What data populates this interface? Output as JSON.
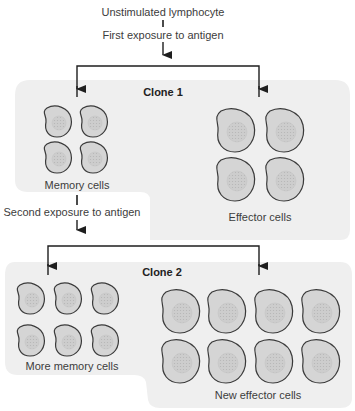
{
  "diagram": {
    "top": {
      "start_label": "Unstimulated lymphocyte",
      "first_exposure_label": "First exposure to antigen"
    },
    "clone1": {
      "title": "Clone 1",
      "memory_label": "Memory cells",
      "effector_label": "Effector cells",
      "memory_cell_count": 4,
      "effector_cell_count": 4
    },
    "second_exposure_label": "Second exposure to antigen",
    "clone2": {
      "title": "Clone 2",
      "memory_label": "More memory cells",
      "effector_label": "New effector cells",
      "memory_cell_count": 6,
      "effector_cell_count": 8
    },
    "colors": {
      "panel_bg": "#efefef",
      "cell_fill": "#d5d5d5",
      "cell_outline": "#3a3a3a",
      "nucleus_fill": "#c9c9c9",
      "arrow": "#1e1e1e"
    }
  }
}
